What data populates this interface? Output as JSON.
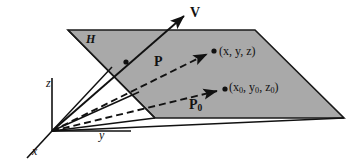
{
  "figure": {
    "width": 358,
    "height": 162,
    "background_color": "#ffffff",
    "plane": {
      "name": "H",
      "label": "H",
      "fill_color": "#a9a9a9",
      "stroke_color": "#1a1a1a",
      "points": "68,30 255,30 344,118 155,118"
    },
    "axes": {
      "origin": {
        "x": 52,
        "y": 131
      },
      "z": {
        "label": "z",
        "end_x": 52,
        "end_y": 78
      },
      "y": {
        "label": "y",
        "end_x": 131,
        "end_y": 131
      },
      "x": {
        "label": "x",
        "end_x": 27,
        "end_y": 158
      }
    },
    "vectors": [
      {
        "name": "V",
        "label": "V",
        "style": "solid",
        "from_x": 52,
        "from_y": 131,
        "to_x": 186,
        "to_y": 14,
        "arrowhead": true,
        "point_on_line": {
          "x": 126,
          "y": 62
        }
      },
      {
        "name": "P",
        "label": "P",
        "style": "dashed",
        "from_x": 52,
        "from_y": 131,
        "to_x": 209,
        "to_y": 53,
        "arrowhead": true,
        "endpoint_label": "(x, y, z)",
        "endpoint_dot": {
          "x": 213,
          "y": 51
        }
      },
      {
        "name": "P0",
        "label": "P",
        "label_subscript": "0",
        "style": "dashed",
        "from_x": 52,
        "from_y": 131,
        "to_x": 219,
        "to_y": 91,
        "arrowhead": true,
        "endpoint_label_base": "(x",
        "endpoint_dot": {
          "x": 224,
          "y": 90
        }
      }
    ],
    "endpoint_labels": {
      "upper": "(x, y, z)",
      "lower_parts": {
        "open": "(x",
        "sub1": "0",
        "mid1": ", y",
        "sub2": "0",
        "mid2": ", z",
        "sub3": "0",
        "close": ")"
      }
    },
    "construction_lines": [
      {
        "name": "ray-to-plane-near-left",
        "from_x": 52,
        "from_y": 131,
        "to_x": 155,
        "to_y": 118
      },
      {
        "name": "ray-to-plane-far-left",
        "from_x": 52,
        "from_y": 131,
        "to_x": 141,
        "to_y": 94
      },
      {
        "name": "ray-to-plane-upper-left",
        "from_x": 52,
        "from_y": 131,
        "to_x": 115,
        "to_y": 70
      },
      {
        "name": "plane-bottom-extension",
        "from_x": 52,
        "from_y": 131,
        "to_x": 344,
        "to_y": 118
      }
    ]
  }
}
